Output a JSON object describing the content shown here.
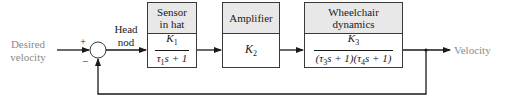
{
  "diagram": {
    "type": "feedback-control-block-diagram",
    "input": {
      "label_line1": "Desired",
      "label_line2": "velocity"
    },
    "output": {
      "label": "Velocity"
    },
    "summing_junction": {
      "plus_sign": "+",
      "minus_sign": "−"
    },
    "signal_after_junction": {
      "label_line1": "Head",
      "label_line2": "nod"
    },
    "blocks": [
      {
        "id": "sensor",
        "title_line1": "Sensor",
        "title_line2": "in hat",
        "tf_num": "K",
        "tf_num_sub": "1",
        "tf_den_tau": "τ",
        "tf_den_sub": "1",
        "tf_den_rest": "s + 1"
      },
      {
        "id": "amplifier",
        "title": "Amplifier",
        "gain": "K",
        "gain_sub": "2"
      },
      {
        "id": "wheelchair",
        "title_line1": "Wheelchair",
        "title_line2": "dynamics",
        "tf_num": "K",
        "tf_num_sub": "3",
        "tf_den_p1": "(τ",
        "tf_den_sub1": "3",
        "tf_den_p2": "s + 1)(τ",
        "tf_den_sub2": "4",
        "tf_den_p3": "s + 1)"
      }
    ],
    "feedback": {
      "type": "unity",
      "sign": "negative"
    },
    "colors": {
      "line": "#1a1a1a",
      "header_fill": "#e8e8e8",
      "io_text": "#8a8a8a"
    }
  }
}
